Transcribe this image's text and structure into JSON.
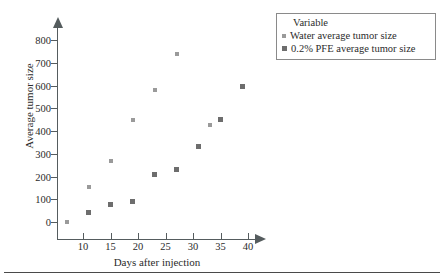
{
  "chart_data": {
    "type": "scatter",
    "title": "",
    "xlabel": "Days after injection",
    "ylabel": "Average tumor size",
    "xlim": [
      5,
      43
    ],
    "ylim": [
      0,
      840
    ],
    "xticks": [
      10,
      15,
      20,
      25,
      30,
      35,
      40
    ],
    "yticks": [
      0,
      100,
      200,
      300,
      400,
      500,
      600,
      700,
      800
    ],
    "xtick_labels": [
      "10",
      "15",
      "20",
      "25",
      "30",
      "35",
      "40"
    ],
    "ytick_labels": [
      "0",
      "100",
      "200",
      "300",
      "400",
      "500",
      "600",
      "700",
      "800"
    ],
    "grid": false,
    "legend_position": "top-right",
    "legend_title": "Variable",
    "series": [
      {
        "name": "Water average tumor size",
        "marker": "small-square",
        "color": "#9a9a9a",
        "points": [
          {
            "x": 7,
            "y": 0
          },
          {
            "x": 11,
            "y": 155
          },
          {
            "x": 15,
            "y": 270
          },
          {
            "x": 19,
            "y": 450
          },
          {
            "x": 23,
            "y": 580
          },
          {
            "x": 27,
            "y": 740
          },
          {
            "x": 33,
            "y": 425
          }
        ]
      },
      {
        "name": "0.2% PFE average tumor size",
        "marker": "square",
        "color": "#6d6d6d",
        "points": [
          {
            "x": 11,
            "y": 40
          },
          {
            "x": 15,
            "y": 75
          },
          {
            "x": 19,
            "y": 90
          },
          {
            "x": 23,
            "y": 210
          },
          {
            "x": 27,
            "y": 230
          },
          {
            "x": 31,
            "y": 330
          },
          {
            "x": 35,
            "y": 450
          },
          {
            "x": 39,
            "y": 595
          }
        ]
      }
    ]
  },
  "legend": {
    "title": "Variable",
    "entries": [
      {
        "label": "Water average tumor size",
        "marker": "water-marker"
      },
      {
        "label": "0.2% PFE average tumor size",
        "marker": "pfe-marker"
      }
    ]
  },
  "axes": {
    "x_title": "Days after injection",
    "y_title": "Average tumor size"
  }
}
